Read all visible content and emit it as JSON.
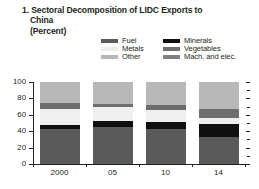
{
  "figure": {
    "number": "1.",
    "title_line1": "1. Sectoral Decomposition of LIDC Exports to",
    "title_line2": "China",
    "units": "(Percent)"
  },
  "legend": {
    "items": [
      {
        "label": "Fuel",
        "color": "#5a5a5a",
        "key": "fuel"
      },
      {
        "label": "Minerals",
        "color": "#101010",
        "key": "minerals"
      },
      {
        "label": "Metals",
        "color": "#efefef",
        "key": "metals"
      },
      {
        "label": "Vegetables",
        "color": "#6e6e6e",
        "key": "vegetables"
      },
      {
        "label": "Other",
        "color": "#b8b8b8",
        "key": "other"
      },
      {
        "label": "Mach. and elec.",
        "color": "#808080",
        "key": "mach_elec"
      }
    ]
  },
  "axes": {
    "y_ticks": [
      "100",
      "80",
      "60",
      "40",
      "20",
      "0"
    ],
    "x_ticks": [
      "2000",
      "05",
      "10",
      "14"
    ]
  },
  "chart_data": {
    "type": "bar",
    "subtype": "stacked-100",
    "title": "1. Sectoral Decomposition of LIDC Exports to China (Percent)",
    "xlabel": "",
    "ylabel": "Percent",
    "ylim": [
      0,
      100
    ],
    "yticks": [
      0,
      20,
      40,
      60,
      80,
      100
    ],
    "grid": false,
    "legend_position": "top",
    "categories": [
      "2000",
      "05",
      "10",
      "14"
    ],
    "series": [
      {
        "name": "Fuel",
        "color": "#5a5a5a",
        "values": [
          43,
          45,
          43,
          33
        ]
      },
      {
        "name": "Minerals",
        "color": "#101010",
        "values": [
          4,
          8,
          8,
          16
        ]
      },
      {
        "name": "Metals",
        "color": "#efefef",
        "values": [
          20,
          17,
          15,
          7
        ]
      },
      {
        "name": "Vegetables",
        "color": "#6e6e6e",
        "values": [
          8,
          3,
          6,
          11
        ]
      },
      {
        "name": "Mach. and elec.",
        "color": "#808080",
        "values": [
          0,
          0,
          0,
          0
        ]
      },
      {
        "name": "Other",
        "color": "#b8b8b8",
        "values": [
          25,
          27,
          28,
          33
        ]
      }
    ]
  }
}
